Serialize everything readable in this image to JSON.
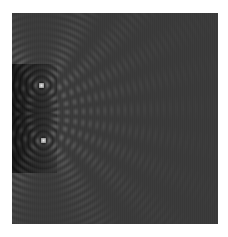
{
  "image": {
    "description": "Two-point-source wave interference pattern, grayscale",
    "alt": "Interference pattern of circular waves from two point sources",
    "width": 206,
    "height": 211,
    "background": "#ffffff",
    "base_gray": "#3a3a3a",
    "sources": [
      {
        "x": 29,
        "y": 72
      },
      {
        "x": 31,
        "y": 127
      }
    ],
    "wavelength": 12.5,
    "dark_region_color": "#000000",
    "crest_color": "#a0a0a0"
  }
}
